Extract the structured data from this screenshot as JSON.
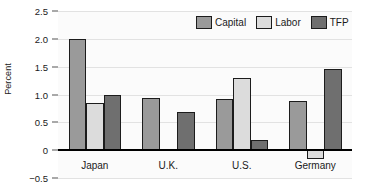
{
  "chart_data": {
    "type": "bar",
    "title": "",
    "xlabel": "",
    "ylabel": "Percent",
    "ylim": [
      -0.5,
      2.5
    ],
    "yticks": [
      2.5,
      2.0,
      1.5,
      1.0,
      0.5,
      0,
      -0.5
    ],
    "ytick_labels": [
      "2.5",
      "2.0",
      "1.5",
      "1.0",
      "0.5",
      "0",
      "−0.5"
    ],
    "grid": true,
    "legend_position": "top-right",
    "categories": [
      "Japan",
      "U.K.",
      "U.S.",
      "Germany"
    ],
    "series": [
      {
        "name": "Capital",
        "color": "#9a9a9a",
        "values": [
          2.0,
          0.93,
          0.92,
          0.89
        ]
      },
      {
        "name": "Labor",
        "color": "#dcdcdc",
        "values": [
          0.85,
          0.0,
          1.3,
          -0.15
        ]
      },
      {
        "name": "TFP",
        "color": "#6f6f6f",
        "values": [
          1.0,
          0.68,
          0.18,
          1.45
        ]
      }
    ]
  },
  "legend": {
    "items": [
      {
        "label": "Capital",
        "color": "#9a9a9a"
      },
      {
        "label": "Labor",
        "color": "#dcdcdc"
      },
      {
        "label": "TFP",
        "color": "#6f6f6f"
      }
    ]
  },
  "axis": {
    "y_title": "Percent"
  }
}
